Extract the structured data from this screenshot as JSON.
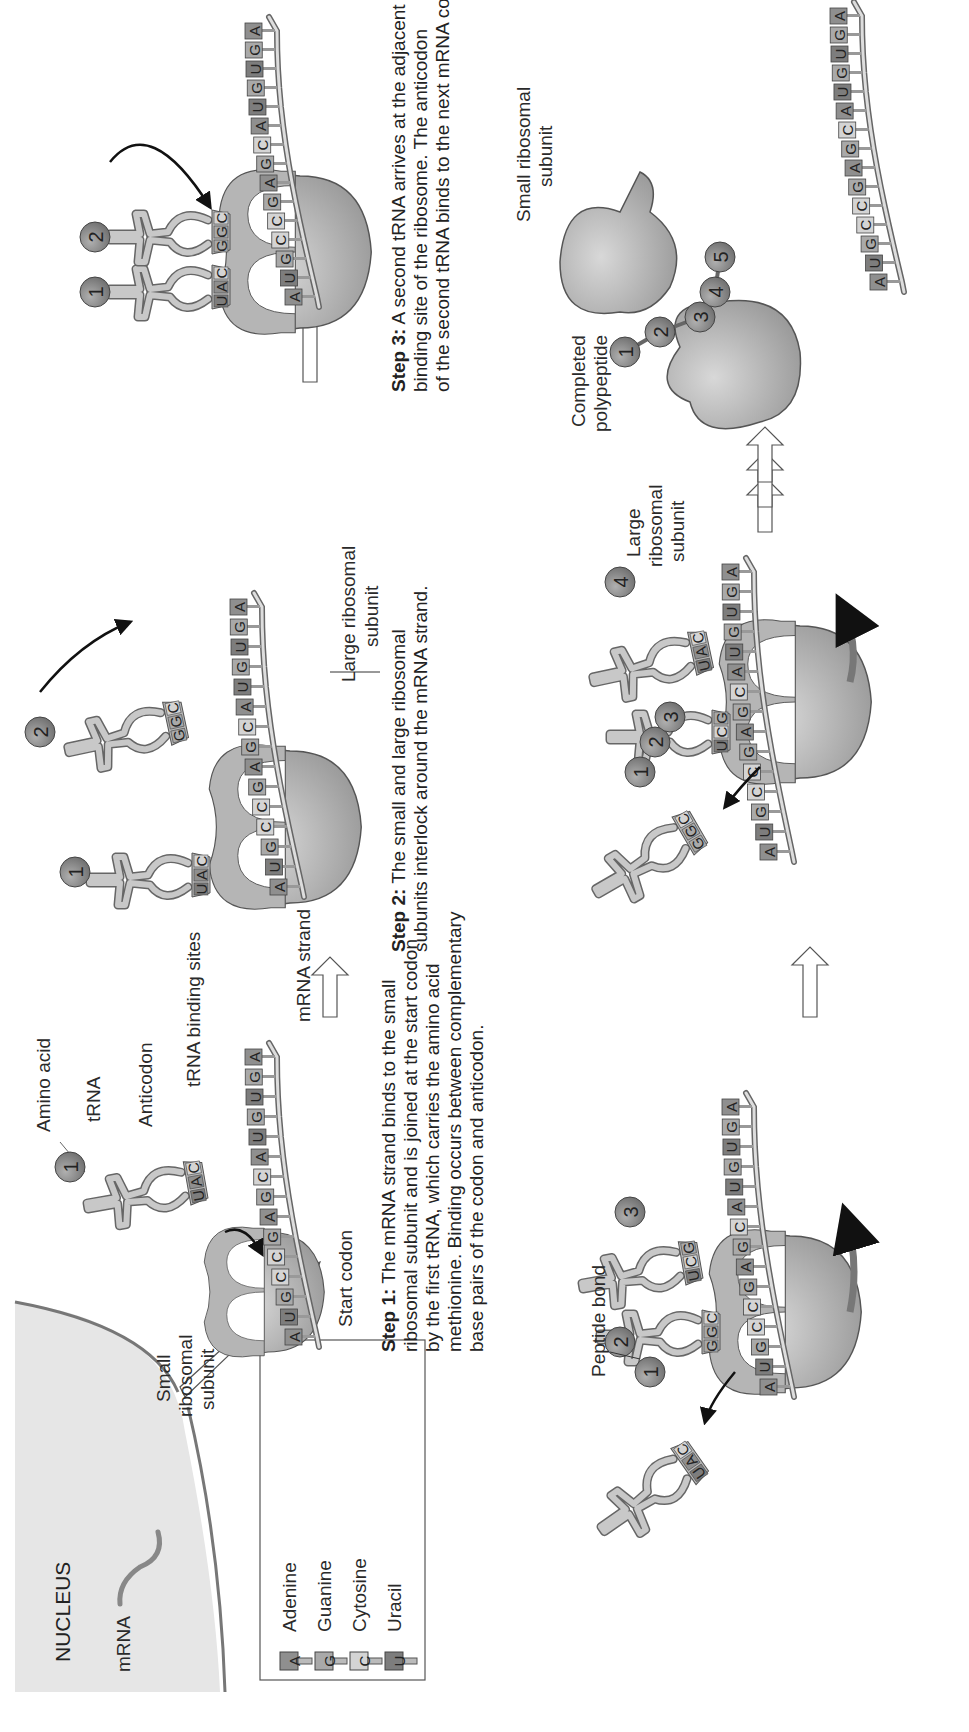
{
  "figure": {
    "orientation": "rotated 90 degrees counter-clockwise",
    "nucleus": {
      "title": "NUCLEUS",
      "mrna_label": "mRNA"
    },
    "legend": {
      "items": [
        {
          "symbol": "A",
          "name": "Adenine",
          "color": "#8f8f8f"
        },
        {
          "symbol": "G",
          "name": "Guanine",
          "color": "#a9a9a9"
        },
        {
          "symbol": "C",
          "name": "Cytosine",
          "color": "#d4d4d4"
        },
        {
          "symbol": "U",
          "name": "Uracil",
          "color": "#7d7d7d"
        }
      ]
    },
    "step1": {
      "labels": {
        "amino_acid": "Amino acid",
        "trna": "tRNA",
        "anticodon": "Anticodon",
        "binding_sites": "tRNA binding sites",
        "small_subunit_1": "Small",
        "small_subunit_2": "ribosomal",
        "small_subunit_3": "subunit",
        "mrna_strand": "mRNA strand",
        "start_codon": "Start codon"
      },
      "amino_acid_number": "1",
      "anticodon": [
        "U",
        "A",
        "C"
      ],
      "mrna": [
        "A",
        "U",
        "G",
        "C",
        "C",
        "G",
        "A",
        "G",
        "C",
        "A",
        "U",
        "G",
        "U",
        "G",
        "A"
      ],
      "caption_bold": "Step 1:",
      "caption_lines": [
        " The mRNA strand binds to the small",
        "ribosomal subunit and is joined at the start codon",
        "by the first tRNA, which carries the amino acid",
        "methionine. Binding occurs between complementary",
        "base pairs of the codon and anticodon."
      ]
    },
    "step2": {
      "labels": {
        "large_subunit_1": "Large ribosomal",
        "large_subunit_2": "subunit"
      },
      "amino_acids": [
        "1",
        "2"
      ],
      "anticodon_1": [
        "U",
        "A",
        "C"
      ],
      "anticodon_2": [
        "G",
        "G",
        "C"
      ],
      "mrna": [
        "A",
        "U",
        "G",
        "C",
        "C",
        "G",
        "A",
        "G",
        "C",
        "A",
        "U",
        "G",
        "U",
        "G",
        "A"
      ],
      "caption_bold": "Step 2:",
      "caption_lines": [
        " The small and large ribosomal",
        "subunits interlock around the mRNA strand."
      ]
    },
    "step3": {
      "amino_acids": [
        "1",
        "2"
      ],
      "anticodon_1": [
        "U",
        "A",
        "C"
      ],
      "anticodon_2": [
        "G",
        "G",
        "C"
      ],
      "mrna": [
        "A",
        "U",
        "G",
        "C",
        "C",
        "G",
        "A",
        "G",
        "C",
        "A",
        "U",
        "G",
        "U",
        "G",
        "A"
      ],
      "caption_bold": "Step 3:",
      "caption_lines": [
        " A second tRNA arrives at the adjacent",
        "binding site of the ribosome. The anticodon",
        "of the second tRNA binds to the next mRNA codon."
      ]
    },
    "step4": {
      "labels": {
        "peptide_bond": "Peptide bond"
      },
      "amino_acids": [
        "1",
        "2",
        "3"
      ],
      "released_anticodon": [
        "U",
        "A",
        "C"
      ],
      "anticodon_2": [
        "G",
        "G",
        "C"
      ],
      "anticodon_3": [
        "U",
        "C",
        "G"
      ],
      "mrna": [
        "A",
        "U",
        "G",
        "C",
        "C",
        "G",
        "A",
        "G",
        "C",
        "A",
        "U",
        "G",
        "U",
        "G",
        "A"
      ]
    },
    "step5": {
      "amino_acids": [
        "1",
        "2",
        "3",
        "4"
      ],
      "released_anticodon": [
        "G",
        "G",
        "C"
      ],
      "anticodon_3": [
        "U",
        "C",
        "G"
      ],
      "anticodon_4": [
        "U",
        "A",
        "C"
      ],
      "mrna": [
        "A",
        "U",
        "G",
        "C",
        "C",
        "G",
        "A",
        "G",
        "C",
        "A",
        "U",
        "G",
        "U",
        "G",
        "A"
      ]
    },
    "step6": {
      "labels": {
        "large_subunit_1": "Large",
        "large_subunit_2": "ribosomal",
        "large_subunit_3": "subunit",
        "polypeptide_1": "Completed",
        "polypeptide_2": "polypeptide",
        "small_subunit_1": "Small ribosomal",
        "small_subunit_2": "subunit"
      },
      "amino_acids": [
        "1",
        "2",
        "3",
        "4",
        "5"
      ],
      "mrna": [
        "A",
        "U",
        "G",
        "C",
        "C",
        "G",
        "A",
        "G",
        "C",
        "A",
        "U",
        "G",
        "U",
        "G",
        "A"
      ]
    },
    "colors": {
      "ribosome": "#a8a8a8",
      "ribosome_dark": "#8c8c8c",
      "trna": "#c8c8c8",
      "amino_acid": "#8a8a8a",
      "outline": "#555555",
      "nucleus_fill": "#e6e6e6"
    }
  }
}
